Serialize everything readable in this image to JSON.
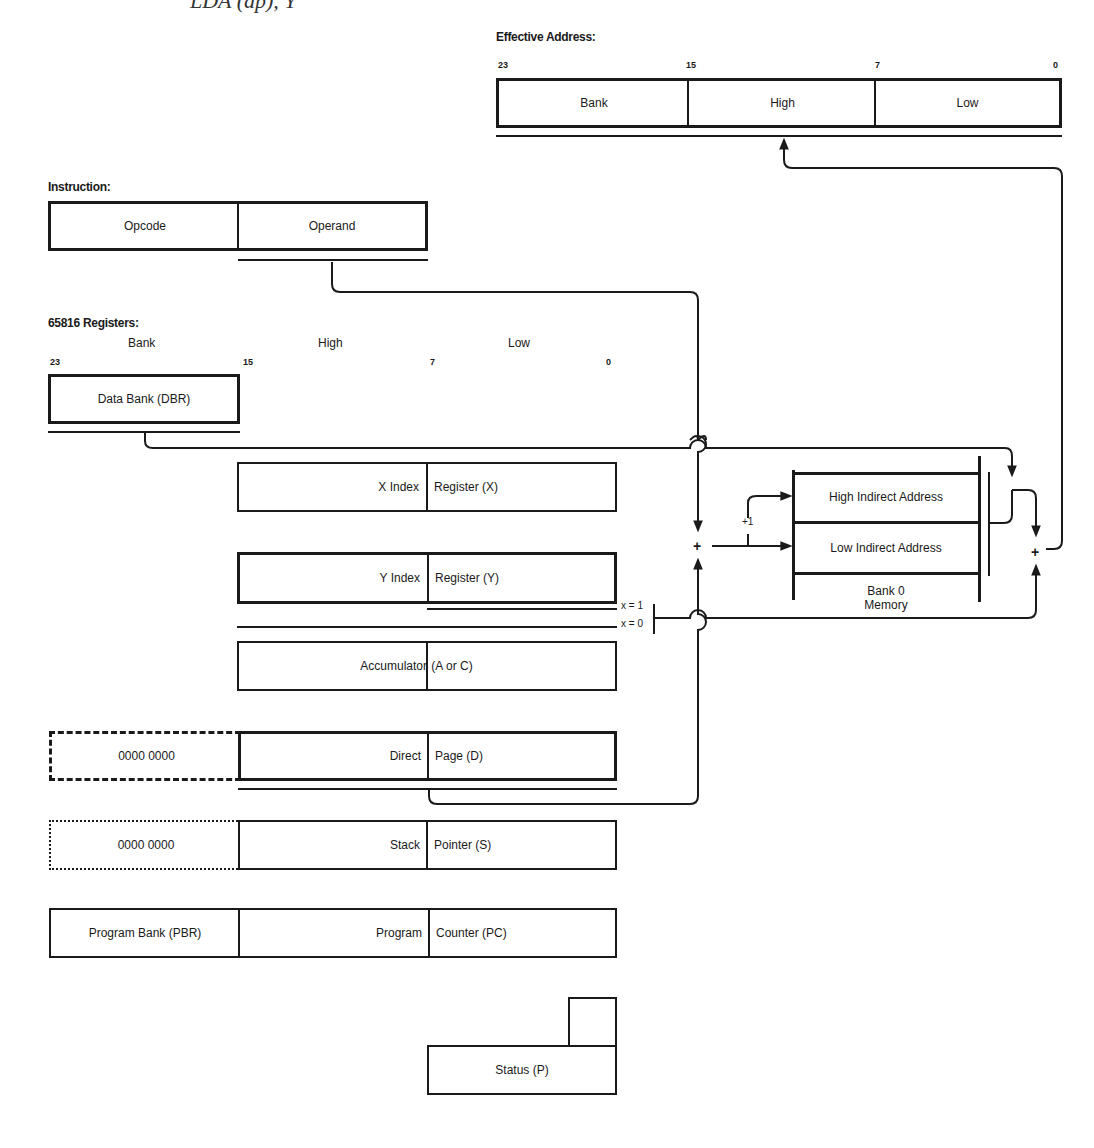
{
  "title": "LDA (dp), Y",
  "effective_address": {
    "label": "Effective Address:",
    "bits": [
      "23",
      "15",
      "7",
      "0"
    ],
    "fields": [
      "Bank",
      "High",
      "Low"
    ]
  },
  "instruction": {
    "label": "Instruction:",
    "fields": [
      "Opcode",
      "Operand"
    ]
  },
  "registers": {
    "label": "65816 Registers:",
    "columns": [
      "Bank",
      "High",
      "Low"
    ],
    "bits": [
      "23",
      "15",
      "7",
      "0"
    ],
    "dbr": "Data Bank (DBR)",
    "x": {
      "left": "X Index",
      "right": "Register (X)"
    },
    "y": {
      "left": "Y Index",
      "right": "Register (Y)"
    },
    "acc": {
      "left": "Accumulator",
      "right": " (A or C)"
    },
    "d": {
      "bank": "0000 0000",
      "left": "Direct",
      "right": "Page (D)"
    },
    "s": {
      "bank": "0000 0000",
      "left": "Stack",
      "right": "Pointer (S)"
    },
    "pc": {
      "bank": "Program Bank (PBR)",
      "left": "Program",
      "right": "Counter (PC)"
    },
    "p": "Status (P)"
  },
  "memory": {
    "high": "High Indirect Address",
    "low": "Low Indirect Address",
    "caption_line1": "Bank 0",
    "caption_line2": "Memory",
    "increment": "+1"
  },
  "flags": {
    "x1": "x = 1",
    "x0": "x = 0"
  },
  "adders": [
    "+",
    "+"
  ]
}
